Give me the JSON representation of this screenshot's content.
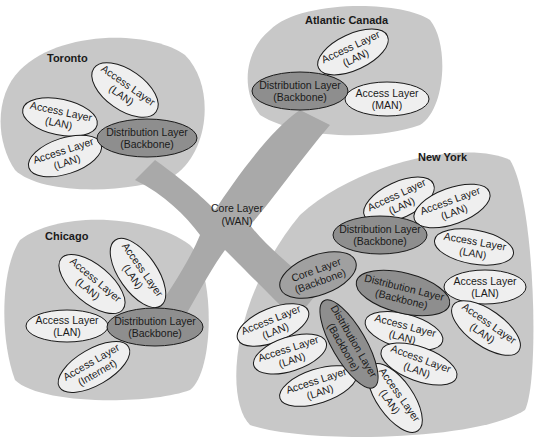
{
  "diagram": {
    "core": {
      "line1": "Core Layer",
      "line2": "(WAN)"
    },
    "regions": {
      "toronto": {
        "title": "Toronto",
        "distribution": {
          "line1": "Distribution Layer",
          "line2": "(Backbone)"
        },
        "access": [
          {
            "line1": "Access Layer",
            "line2": "(LAN)"
          },
          {
            "line1": "Access Layer",
            "line2": "(LAN)"
          },
          {
            "line1": "Access Layer",
            "line2": "(LAN)"
          }
        ]
      },
      "atlantic": {
        "title": "Atlantic Canada",
        "distribution": {
          "line1": "Distribution Layer",
          "line2": "(Backbone)"
        },
        "access": [
          {
            "line1": "Access Layer",
            "line2": "(LAN)"
          },
          {
            "line1": "Access Layer",
            "line2": "(MAN)"
          }
        ]
      },
      "chicago": {
        "title": "Chicago",
        "distribution": {
          "line1": "Distribution Layer",
          "line2": "(Backbone)"
        },
        "access": [
          {
            "line1": "Access Layer",
            "line2": "(LAN)"
          },
          {
            "line1": "Access Layer",
            "line2": "(LAN)"
          },
          {
            "line1": "Access Layer",
            "line2": "(LAN)"
          },
          {
            "line1": "Access Layer",
            "line2": "(Internet)"
          }
        ]
      },
      "newyork": {
        "title": "New York",
        "core": {
          "line1": "Core Layer",
          "line2": "(Backbone)"
        },
        "distributions": [
          {
            "line1": "Distribution Layer",
            "line2": "(Backbone)"
          },
          {
            "line1": "Distribution Layer",
            "line2": "(Backbone)"
          },
          {
            "line1": "Distribution Layer",
            "line2": "(Backbone)"
          }
        ],
        "access": [
          {
            "line1": "Access Layer",
            "line2": "(LAN)"
          },
          {
            "line1": "Access Layer",
            "line2": "(LAN)"
          },
          {
            "line1": "Access Layer",
            "line2": "(LAN)"
          },
          {
            "line1": "Access Layer",
            "line2": "(LAN)"
          },
          {
            "line1": "Access Layer",
            "line2": "(LAN)"
          },
          {
            "line1": "Access Layer",
            "line2": "(LAN)"
          },
          {
            "line1": "Access Layer",
            "line2": "(LAN)"
          },
          {
            "line1": "Access Layer",
            "line2": "(LAN)"
          },
          {
            "line1": "Access Layer",
            "line2": "(LAN)"
          },
          {
            "line1": "Access Layer",
            "line2": "(LAN)"
          },
          {
            "line1": "Access Layer",
            "line2": "(LAN)"
          }
        ]
      }
    }
  },
  "colors": {
    "region": "#c8c8c8",
    "core": "#a9a9a9",
    "distribution": "#8e8e8e",
    "access": "#efefef"
  }
}
